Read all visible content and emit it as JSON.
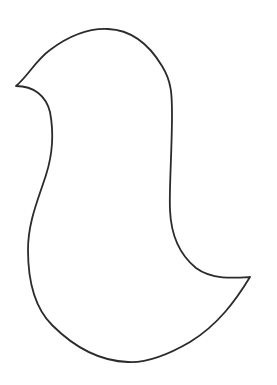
{
  "drawing": {
    "subject": "bird-silhouette-outline",
    "stroke_color": "#2b2b2b",
    "background_color": "#ffffff",
    "path": "M16 86 C 28 76, 36 60, 50 50 C 66 38, 86 28, 108 29 C 132 30, 150 46, 162 66 C 172 82, 172 96, 172 115 C 172 150, 169 190, 170 210 C 171 235, 180 255, 196 268 C 212 280, 235 278, 250 277 C 236 300, 218 325, 190 342 C 166 356, 146 363, 128 362 C 98 361, 72 345, 52 325 C 32 305, 28 275, 28 250 C 28 222, 38 200, 46 175 C 54 150, 53 128, 50 112 C 46 96, 34 86, 16 86 Z"
  }
}
